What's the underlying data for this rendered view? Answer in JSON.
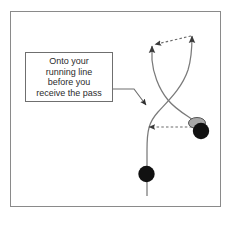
{
  "diagram": {
    "frame": {
      "border_color": "#8a8a8a",
      "background_color": "#ffffff"
    },
    "callout": {
      "border_color": "#6f6f6f",
      "text_color": "#2b2b2b",
      "lines": [
        "Onto your",
        "running line",
        "before you",
        "receive the pass"
      ],
      "full_text": "Onto your running line before you receive the pass"
    },
    "legend_colors": {
      "player": "#111111",
      "ball": "#a8a8a8",
      "ball_outline": "#555555",
      "run_line": "#7a7a7a",
      "pass_line": "#6a6a6a",
      "pointer_line": "#6f6f6f"
    },
    "players": [
      {
        "name": "ball-carrier",
        "marker": "black-circle",
        "x": 201,
        "y": 130,
        "radius": 8
      },
      {
        "name": "support-runner",
        "marker": "black-circle",
        "x": 146,
        "y": 174,
        "radius": 8
      }
    ],
    "ball": {
      "name": "ball",
      "marker": "grey-ellipse",
      "x": 197,
      "y": 123,
      "rx": 8,
      "ry": 5
    },
    "run_lines": [
      {
        "name": "support-runner-run-line",
        "style": "solid",
        "arrow": "up",
        "description": "Runner starts below, runs up and curves right crossing the ball-carrier's line, finishing with an upward arrow at top right"
      },
      {
        "name": "ball-carrier-run-line",
        "style": "solid",
        "arrow": "up",
        "description": "Ball carrier runs up and curves left crossing the runner's line, finishing with an upward arrow at top left"
      }
    ],
    "pass_lines": [
      {
        "name": "pass-to-runner",
        "style": "dashed",
        "arrow": "left",
        "from_x": 192,
        "from_y": 127,
        "to_x": 147,
        "to_y": 127
      },
      {
        "name": "second-pass-top",
        "style": "dashed",
        "arrow": "left",
        "from_x": 192,
        "from_y": 35,
        "to_x": 152,
        "to_y": 45
      }
    ],
    "pointer": {
      "name": "callout-pointer",
      "style": "solid",
      "arrow": "down-right",
      "description": "Leader line from callout box right edge angling down to an arrowhead on the crossing run line"
    }
  }
}
